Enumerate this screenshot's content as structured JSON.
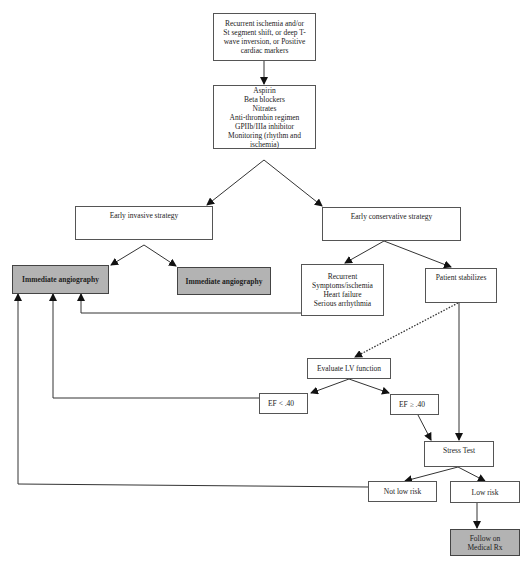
{
  "diagram": {
    "nodes": {
      "presentation": "Recurrent ischemia and/or\nSt segment shift, or deep T-\nwave inversion, or Positive\ncardiac markers",
      "treatment": "Aspirin\nBeta blockers\nNitrates\nAnti-thrombin regimen\nGPIIb/IIIa inhibitor\nMonitoring (rhythm and\nischemia)",
      "early_invasive": "Early invasive strategy",
      "early_conservative": "Early conservative strategy",
      "angiography_left": "Immediate angiography",
      "angiography_right": "Immediate angiography",
      "recurrent": "Recurrent\nSymptoms/ischemia\nHeart failure\nSerious arrhythmia",
      "patient_stabilizes": "Patient stabilizes",
      "evaluate_lv": "Evaluate LV function",
      "ef_low": "EF < .40",
      "ef_high": "EF ≥ .40",
      "stress_test": "Stress Test",
      "not_low_risk": "Not low risk",
      "low_risk": "Low risk",
      "follow_medical": "Follow on\nMedical Rx"
    },
    "edges": [
      {
        "from": "presentation",
        "to": "treatment",
        "style": "solid"
      },
      {
        "from": "treatment",
        "to": "early_invasive",
        "style": "solid"
      },
      {
        "from": "treatment",
        "to": "early_conservative",
        "style": "solid"
      },
      {
        "from": "early_invasive",
        "to": "angiography_left",
        "style": "solid"
      },
      {
        "from": "early_invasive",
        "to": "angiography_right",
        "style": "solid"
      },
      {
        "from": "early_conservative",
        "to": "recurrent",
        "style": "solid"
      },
      {
        "from": "early_conservative",
        "to": "patient_stabilizes",
        "style": "solid"
      },
      {
        "from": "recurrent",
        "to": "angiography_left",
        "style": "solid"
      },
      {
        "from": "patient_stabilizes",
        "to": "evaluate_lv",
        "style": "dotted"
      },
      {
        "from": "patient_stabilizes",
        "to": "stress_test",
        "style": "solid"
      },
      {
        "from": "evaluate_lv",
        "to": "ef_low",
        "style": "solid"
      },
      {
        "from": "evaluate_lv",
        "to": "ef_high",
        "style": "solid"
      },
      {
        "from": "ef_low",
        "to": "angiography_left",
        "style": "solid"
      },
      {
        "from": "ef_high",
        "to": "stress_test",
        "style": "solid"
      },
      {
        "from": "stress_test",
        "to": "not_low_risk",
        "style": "solid"
      },
      {
        "from": "stress_test",
        "to": "low_risk",
        "style": "solid"
      },
      {
        "from": "not_low_risk",
        "to": "angiography_left",
        "style": "solid"
      },
      {
        "from": "low_risk",
        "to": "follow_medical",
        "style": "solid"
      }
    ],
    "colors": {
      "terminal_fill": "#b3b3b3",
      "box_fill": "#ffffff",
      "line": "#333333"
    }
  }
}
